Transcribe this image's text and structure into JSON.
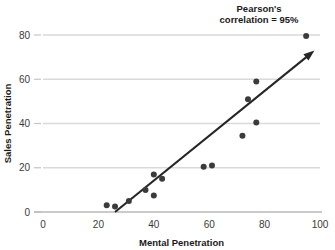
{
  "chart_data": {
    "type": "scatter",
    "title": "",
    "xlabel": "Mental Penetration",
    "ylabel": "Sales Penetration",
    "xlim": [
      0,
      100
    ],
    "ylim": [
      0,
      85
    ],
    "xticks": [
      0,
      20,
      40,
      60,
      80,
      100
    ],
    "yticks": [
      0,
      20,
      40,
      60,
      80
    ],
    "xtick_labels": [
      "0",
      "20",
      "40",
      "60",
      "80",
      "100"
    ],
    "ytick_labels": [
      "0",
      "20",
      "40",
      "60",
      "80"
    ],
    "grid": "horizontal",
    "legend": "none",
    "annotations": [
      {
        "name": "pearson-correlation-note",
        "line1": "Pearson's",
        "line2": "correlation = 95%",
        "x": 78,
        "y": 92
      }
    ],
    "series": [
      {
        "name": "Sales vs Mental Penetration",
        "marker": "circle",
        "color": "#3b3b3b",
        "points": [
          {
            "x": 23,
            "y": 3
          },
          {
            "x": 26,
            "y": 2.5
          },
          {
            "x": 31,
            "y": 5
          },
          {
            "x": 37,
            "y": 10
          },
          {
            "x": 40,
            "y": 7.5
          },
          {
            "x": 40,
            "y": 17
          },
          {
            "x": 43,
            "y": 15
          },
          {
            "x": 58,
            "y": 20.5
          },
          {
            "x": 61,
            "y": 21
          },
          {
            "x": 72,
            "y": 34.5
          },
          {
            "x": 74,
            "y": 51
          },
          {
            "x": 77,
            "y": 40.5
          },
          {
            "x": 77,
            "y": 59
          },
          {
            "x": 95,
            "y": 79.5
          }
        ]
      }
    ],
    "trendline": {
      "name": "fit-arrow",
      "color": "#262626",
      "x_start": 26,
      "y_start": 0,
      "x_end": 98,
      "y_end": 73,
      "arrow_at_end": true
    }
  },
  "colors": {
    "gridline": "#d9d9d9",
    "axis": "#b9b9b9",
    "marker": "#3b3b3b",
    "trend": "#262626",
    "text": "#1a1a1a",
    "tick_text": "#3a3a3a",
    "background": "#ffffff"
  }
}
